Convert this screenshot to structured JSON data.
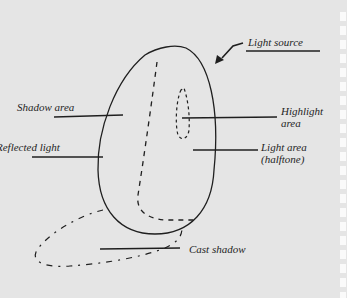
{
  "diagram": {
    "type": "light-and-shadow-on-egg",
    "labels": {
      "light_source": "Light source",
      "shadow_area": "Shadow area",
      "reflected_light": "Reflected light",
      "highlight_line1": "Highlight",
      "highlight_line2": "area",
      "light_area_line1": "Light area",
      "light_area_line2": "(halftone)",
      "cast_shadow": "Cast shadow"
    },
    "colors": {
      "paper": "#e5e5e5",
      "ink": "#1f1f1f",
      "margin": "#ffffff"
    }
  }
}
